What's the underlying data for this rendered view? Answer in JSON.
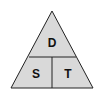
{
  "diagram": {
    "type": "formula-triangle",
    "labels": {
      "top": "D",
      "bottom_left": "S",
      "bottom_right": "T"
    },
    "colors": {
      "fill": "#d9d9d9",
      "stroke": "#222222",
      "background": "#ffffff"
    }
  }
}
